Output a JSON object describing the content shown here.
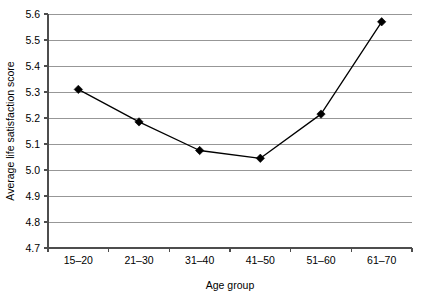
{
  "chart_data": {
    "type": "line",
    "title": "",
    "xlabel": "Age group",
    "ylabel": "Average life satisfaction score",
    "categories": [
      "15–20",
      "21–30",
      "31–40",
      "41–50",
      "51–60",
      "61–70"
    ],
    "values": [
      5.31,
      5.185,
      5.075,
      5.045,
      5.215,
      5.57
    ],
    "ylim": [
      4.7,
      5.6
    ],
    "yticks": [
      4.7,
      4.8,
      4.9,
      5.0,
      5.1,
      5.2,
      5.3,
      5.4,
      5.5,
      5.6
    ],
    "ytick_labels": [
      "4.7",
      "4.8",
      "4.9",
      "5.0",
      "5.1",
      "5.2",
      "5.3",
      "5.4",
      "5.5",
      "5.6"
    ],
    "grid": true,
    "grid_axis": "y",
    "legend": false,
    "legend_position": "none",
    "marker": "diamond",
    "marker_color": "#000000",
    "line_color": "#000000",
    "gridline_color": "#8c8c8c",
    "axis_color": "#4d4d4d",
    "background_color": "#ffffff"
  },
  "axes": {
    "y_axis_title": "Average life satisfaction score",
    "x_axis_title": "Age group"
  }
}
